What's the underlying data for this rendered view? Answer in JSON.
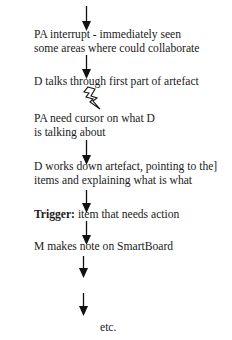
{
  "diagram": {
    "type": "vertical-flow",
    "steps": [
      {
        "id": "step-1",
        "lines": [
          "PA interrupt - immediately seen",
          "some areas where could collaborate"
        ]
      },
      {
        "id": "step-2",
        "lines": [
          "D talks through first part of artefact"
        ]
      },
      {
        "id": "step-3",
        "lines": [
          "PA need cursor on what D",
          "is talking about"
        ],
        "preceded_by": "lightning-bolt"
      },
      {
        "id": "step-4",
        "lines": [
          "D works down artefact, pointing to the]",
          "items and explaining what is what"
        ]
      },
      {
        "id": "step-5",
        "label": "Trigger:",
        "text": " item that needs action"
      },
      {
        "id": "step-6",
        "lines": [
          "M makes note on SmartBoard"
        ]
      },
      {
        "id": "step-7",
        "lines": [
          "etc."
        ]
      }
    ],
    "connectors": [
      {
        "kind": "arrow-down",
        "from": "start",
        "to": "step-1"
      },
      {
        "kind": "arrow-down",
        "from": "step-1",
        "to": "step-2"
      },
      {
        "kind": "lightning-bolt",
        "from": "step-2",
        "to": "step-3"
      },
      {
        "kind": "arrow-down",
        "from": "step-3",
        "to": "step-4"
      },
      {
        "kind": "arrow-down",
        "from": "step-4",
        "to": "step-5"
      },
      {
        "kind": "arrow-down",
        "from": "step-5",
        "to": "step-6"
      },
      {
        "kind": "arrow-down",
        "from": "step-6",
        "to": "gap"
      },
      {
        "kind": "arrow-down",
        "from": "gap",
        "to": "step-7"
      }
    ],
    "colors": {
      "text": "#1a1a1a",
      "arrows": "#111111",
      "background": "#ffffff"
    }
  }
}
